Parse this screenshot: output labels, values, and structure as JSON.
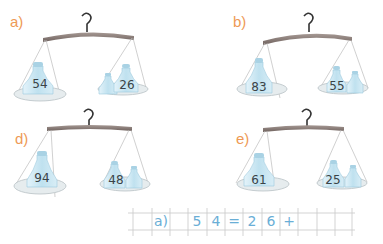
{
  "exercise": {
    "scales": [
      {
        "id": "a",
        "label": "a)",
        "left_weight": "54",
        "right_weight": "26",
        "question_mark": "?"
      },
      {
        "id": "b",
        "label": "b)",
        "left_weight": "83",
        "right_weight": "55",
        "question_mark": "?"
      },
      {
        "id": "d",
        "label": "d)",
        "left_weight": "94",
        "right_weight": "48",
        "question_mark": "?"
      },
      {
        "id": "e",
        "label": "e)",
        "left_weight": "61",
        "right_weight": "25",
        "question_mark": "?"
      }
    ],
    "answer_grid": {
      "cells": [
        "",
        "a)",
        "",
        "5",
        "4",
        "=",
        "2",
        "6",
        "+",
        "",
        "",
        ""
      ]
    }
  },
  "colors": {
    "label": "#ee9a55",
    "beam": "#8a7c78",
    "jar": "#cfe8f3",
    "pan": "#e6ecee",
    "handwriting": "#6aaed6",
    "grid_line": "#c8c8c8"
  }
}
